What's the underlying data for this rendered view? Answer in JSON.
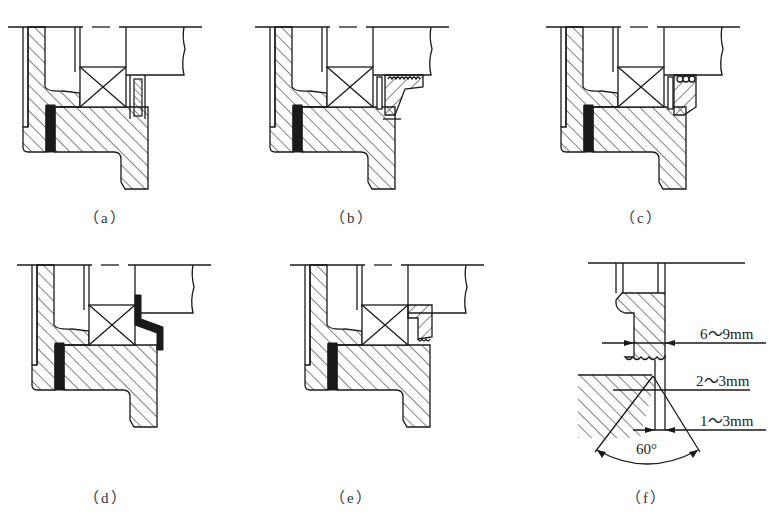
{
  "figure": {
    "panels": [
      {
        "id": "a",
        "caption": "（a）",
        "caption_x": 90,
        "caption_y": 205
      },
      {
        "id": "b",
        "caption": "（b）",
        "caption_x": 335,
        "caption_y": 205
      },
      {
        "id": "c",
        "caption": "（c）",
        "caption_x": 626,
        "caption_y": 205
      },
      {
        "id": "d",
        "caption": "（d）",
        "caption_x": 85,
        "caption_y": 485
      },
      {
        "id": "e",
        "caption": "（e）",
        "caption_x": 335,
        "caption_y": 485
      },
      {
        "id": "f",
        "caption": "（f）",
        "caption_x": 632,
        "caption_y": 485
      }
    ],
    "dimensions": {
      "width_label": "6～9mm",
      "gap_label": "2～3mm",
      "offset_label": "1～3mm",
      "angle_label": "60°"
    }
  }
}
